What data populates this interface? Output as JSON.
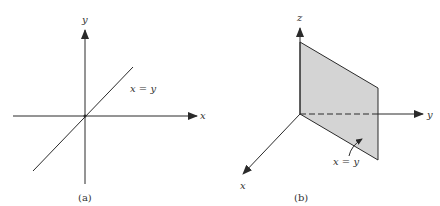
{
  "figure_a": {
    "caption": "(a)",
    "x_axis_label": "x",
    "y_axis_label": "y",
    "line_label": "x = y"
  },
  "figure_b": {
    "caption": "(b)",
    "x_axis_label": "x",
    "y_axis_label": "y",
    "z_axis_label": "z",
    "plane_label": "x = y",
    "plane_fill": "#d4d4d4"
  },
  "colors": {
    "line": "#2a2a2a",
    "text": "#333333",
    "background": "#ffffff"
  }
}
